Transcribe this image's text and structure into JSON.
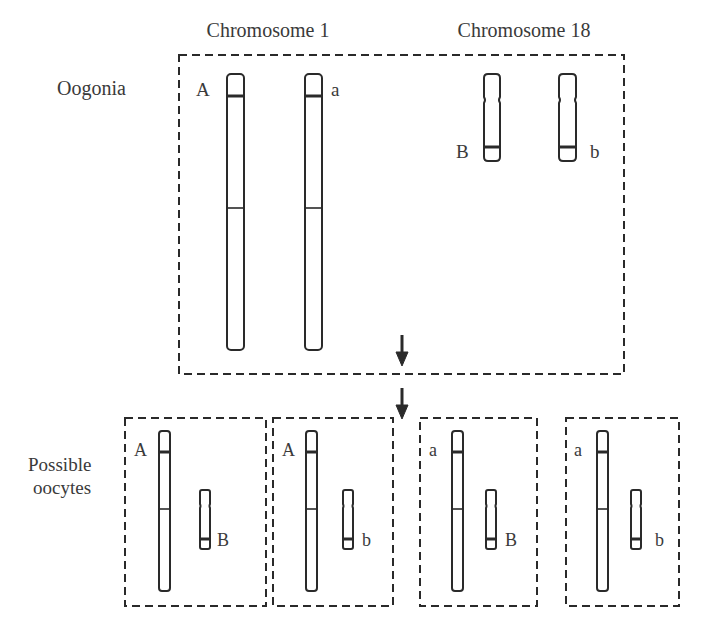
{
  "headers": {
    "chromosome1": "Chromosome 1",
    "chromosome18": "Chromosome 18"
  },
  "row_labels": {
    "oogonia": "Oogonia",
    "oocytes_line1": "Possible",
    "oocytes_line2": "oocytes"
  },
  "oogonia": {
    "chr1_alleles": [
      "A",
      "a"
    ],
    "chr18_alleles": [
      "B",
      "b"
    ]
  },
  "oocytes": [
    {
      "chr1_allele": "A",
      "chr18_allele": "B"
    },
    {
      "chr1_allele": "A",
      "chr18_allele": "b"
    },
    {
      "chr1_allele": "a",
      "chr18_allele": "B"
    },
    {
      "chr1_allele": "a",
      "chr18_allele": "b"
    }
  ],
  "colors": {
    "line": "#2a2a2a",
    "text": "#3a3a3a",
    "background": "#ffffff"
  },
  "icons": {
    "arrow": "arrow-down-icon"
  }
}
